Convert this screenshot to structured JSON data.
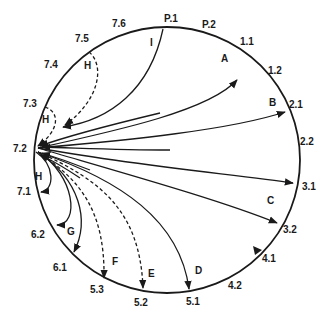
{
  "diagram": {
    "type": "circular-transition-diagram",
    "circle": {
      "cx": 167,
      "cy": 160,
      "r": 133
    },
    "hub_node": "7.2",
    "position_labels": [
      {
        "id": "p1",
        "text": "P.1",
        "x": 164,
        "y": 22
      },
      {
        "id": "p2",
        "text": "P.2",
        "x": 202,
        "y": 28
      },
      {
        "id": "n11",
        "text": "1.1",
        "x": 240,
        "y": 45
      },
      {
        "id": "n12",
        "text": "1.2",
        "x": 268,
        "y": 74
      },
      {
        "id": "n21",
        "text": "2.1",
        "x": 289,
        "y": 108
      },
      {
        "id": "n22",
        "text": "2.2",
        "x": 300,
        "y": 145
      },
      {
        "id": "n31",
        "text": "3.1",
        "x": 302,
        "y": 190
      },
      {
        "id": "n32",
        "text": "3.2",
        "x": 283,
        "y": 233
      },
      {
        "id": "n41",
        "text": "4.1",
        "x": 262,
        "y": 262
      },
      {
        "id": "n42",
        "text": "4.2",
        "x": 228,
        "y": 289
      },
      {
        "id": "n51",
        "text": "5.1",
        "x": 186,
        "y": 305
      },
      {
        "id": "n52",
        "text": "5.2",
        "x": 134,
        "y": 306
      },
      {
        "id": "n53",
        "text": "5.3",
        "x": 90,
        "y": 293
      },
      {
        "id": "n61",
        "text": "6.1",
        "x": 53,
        "y": 271
      },
      {
        "id": "n62",
        "text": "6.2",
        "x": 31,
        "y": 238
      },
      {
        "id": "n71",
        "text": "7.1",
        "x": 17,
        "y": 195
      },
      {
        "id": "n72",
        "text": "7.2",
        "x": 13,
        "y": 152
      },
      {
        "id": "n73",
        "text": "7.3",
        "x": 23,
        "y": 107
      },
      {
        "id": "n74",
        "text": "7.4",
        "x": 44,
        "y": 68
      },
      {
        "id": "n75",
        "text": "7.5",
        "x": 75,
        "y": 42
      },
      {
        "id": "n76",
        "text": "7.6",
        "x": 112,
        "y": 27
      }
    ],
    "arrow_labels": [
      {
        "id": "A",
        "text": "A",
        "x": 221,
        "y": 62
      },
      {
        "id": "B",
        "text": "B",
        "x": 269,
        "y": 106
      },
      {
        "id": "C",
        "text": "C",
        "x": 267,
        "y": 204
      },
      {
        "id": "D",
        "text": "D",
        "x": 195,
        "y": 274
      },
      {
        "id": "E",
        "text": "E",
        "x": 148,
        "y": 277
      },
      {
        "id": "F",
        "text": "F",
        "x": 112,
        "y": 265
      },
      {
        "id": "G",
        "text": "G",
        "x": 67,
        "y": 235
      },
      {
        "id": "H1",
        "text": "H",
        "x": 84,
        "y": 69
      },
      {
        "id": "H2",
        "text": "H",
        "x": 42,
        "y": 123
      },
      {
        "id": "H3",
        "text": "H",
        "x": 35,
        "y": 180
      },
      {
        "id": "I",
        "text": "I",
        "x": 150,
        "y": 46
      }
    ],
    "arrows": [
      {
        "label": "A",
        "from": "7.2",
        "to": "1.1",
        "style": "solid"
      },
      {
        "label": "B",
        "from": "7.2",
        "to": "2.1",
        "style": "solid"
      },
      {
        "label": "C",
        "from": "7.2",
        "to": "3.1",
        "style": "solid"
      },
      {
        "label": "C",
        "from": "7.2",
        "to": "3.2",
        "style": "solid"
      },
      {
        "label": "D",
        "from": "7.2",
        "to": "5.1",
        "style": "solid"
      },
      {
        "label": "E",
        "from": "7.2",
        "to": "5.2",
        "style": "dashed"
      },
      {
        "label": "F",
        "from": "7.2",
        "to": "5.3",
        "style": "dashed"
      },
      {
        "label": "G",
        "from": "7.2",
        "to": "6.1",
        "style": "solid"
      },
      {
        "label": "G",
        "from": "7.2",
        "to": "6.2",
        "style": "solid"
      },
      {
        "label": "H",
        "from": "7.2",
        "to": "7.1",
        "style": "solid"
      },
      {
        "label": "H",
        "from": "7.3",
        "to": "7.2",
        "style": "dashed"
      },
      {
        "label": "H",
        "from": "7.5",
        "to": "7.2",
        "style": "dashed"
      },
      {
        "label": "I",
        "from": "P.1",
        "to": "7.2",
        "style": "solid"
      },
      {
        "label": "",
        "from": "2.1",
        "to": "7.2",
        "style": "solid"
      },
      {
        "label": "",
        "from": "3.1",
        "to": "7.2",
        "style": "solid"
      },
      {
        "label": "",
        "from": "1.2",
        "to": "7.2",
        "style": "solid"
      }
    ],
    "marker_on_circle": {
      "near": "4.1",
      "symbol": "triangle"
    }
  }
}
